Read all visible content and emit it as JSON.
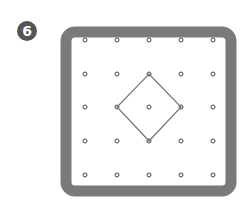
{
  "badge": {
    "label": "6",
    "color": "#555555"
  },
  "board": {
    "frame_color": "#7a7a7a",
    "grid_rows": 5,
    "grid_cols": 5,
    "peg_color": "#444444"
  },
  "shape": {
    "type": "square rotated 45° (diamond)",
    "vertices": [
      [
        2,
        1
      ],
      [
        3,
        2
      ],
      [
        2,
        3
      ],
      [
        1,
        2
      ]
    ],
    "stroke_color": "#777777"
  }
}
